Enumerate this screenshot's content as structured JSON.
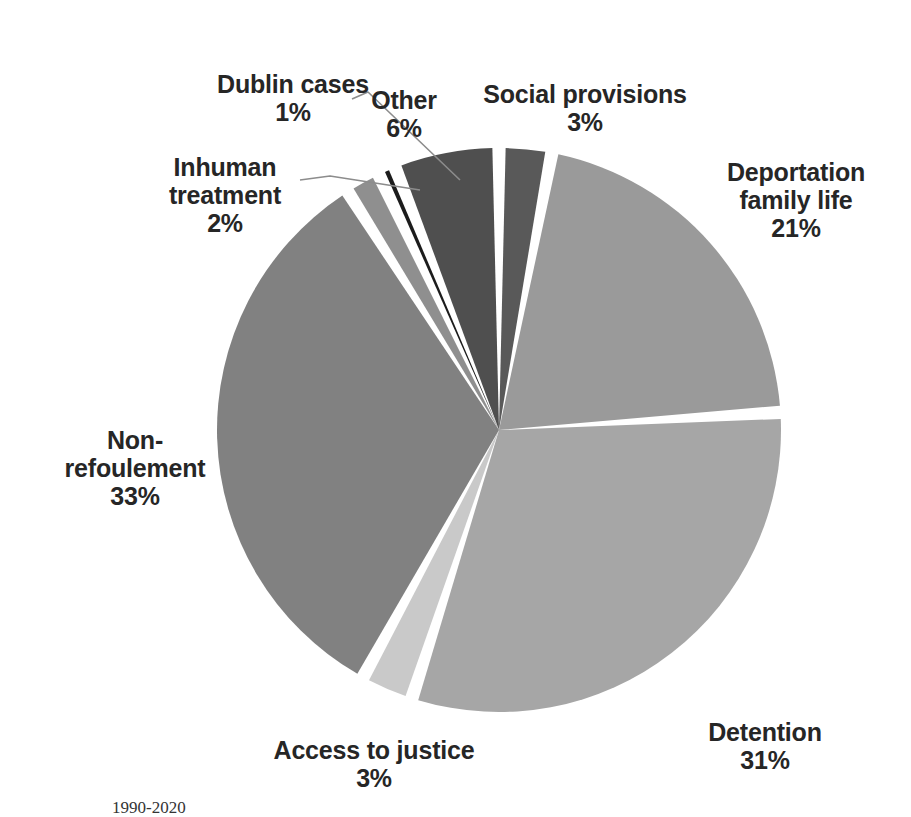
{
  "chart_data": {
    "type": "pie",
    "title": "",
    "legend_position": "outside-labels",
    "start_angle_deg": 0,
    "direction": "clockwise",
    "total": 100,
    "unit": "%",
    "categories": [
      "Social provisions",
      "Deportation family life",
      "Detention",
      "Access to justice",
      "Non-refoulement",
      "Inhuman treatment",
      "Dublin cases",
      "Other"
    ],
    "values": [
      3,
      21,
      31,
      3,
      33,
      2,
      1,
      6
    ],
    "slices": [
      {
        "label": "Social provisions",
        "value": 3,
        "display": "3%",
        "color": "#595959"
      },
      {
        "label": "Deportation family life",
        "value": 21,
        "display": "21%",
        "color": "#9a9a9a"
      },
      {
        "label": "Detention",
        "value": 31,
        "display": "31%",
        "color": "#a6a6a6"
      },
      {
        "label": "Access to justice",
        "value": 3,
        "display": "3%",
        "color": "#c9c9c9"
      },
      {
        "label": "Non-refoulement",
        "value": 33,
        "display": "33%",
        "color": "#818181"
      },
      {
        "label": "Inhuman treatment",
        "value": 2,
        "display": "2%",
        "color": "#8f8f8f"
      },
      {
        "label": "Dublin cases",
        "value": 1,
        "display": "1%",
        "color": "#1c1c1c"
      },
      {
        "label": "Other",
        "value": 6,
        "display": "6%",
        "color": "#4f4f4f"
      }
    ]
  },
  "labels": {
    "dublin": {
      "name": "Dublin cases",
      "pct": "1%"
    },
    "inhuman": {
      "name": "Inhuman\ntreatment",
      "pct": "2%"
    },
    "other": {
      "name": "Other",
      "pct": "6%"
    },
    "social": {
      "name": "Social provisions",
      "pct": "3%"
    },
    "deportation": {
      "name": "Deportation\nfamily life",
      "pct": "21%"
    },
    "detention": {
      "name": "Detention",
      "pct": "31%"
    },
    "access": {
      "name": "Access to justice",
      "pct": "3%"
    },
    "nonrefoulement": {
      "name": "Non-\nrefoulement",
      "pct": "33%"
    }
  },
  "caption": "1990-2020",
  "colors": {
    "background": "#ffffff",
    "separator": "#ffffff",
    "leader_line": "#8c8c8c",
    "text": "#262626"
  }
}
